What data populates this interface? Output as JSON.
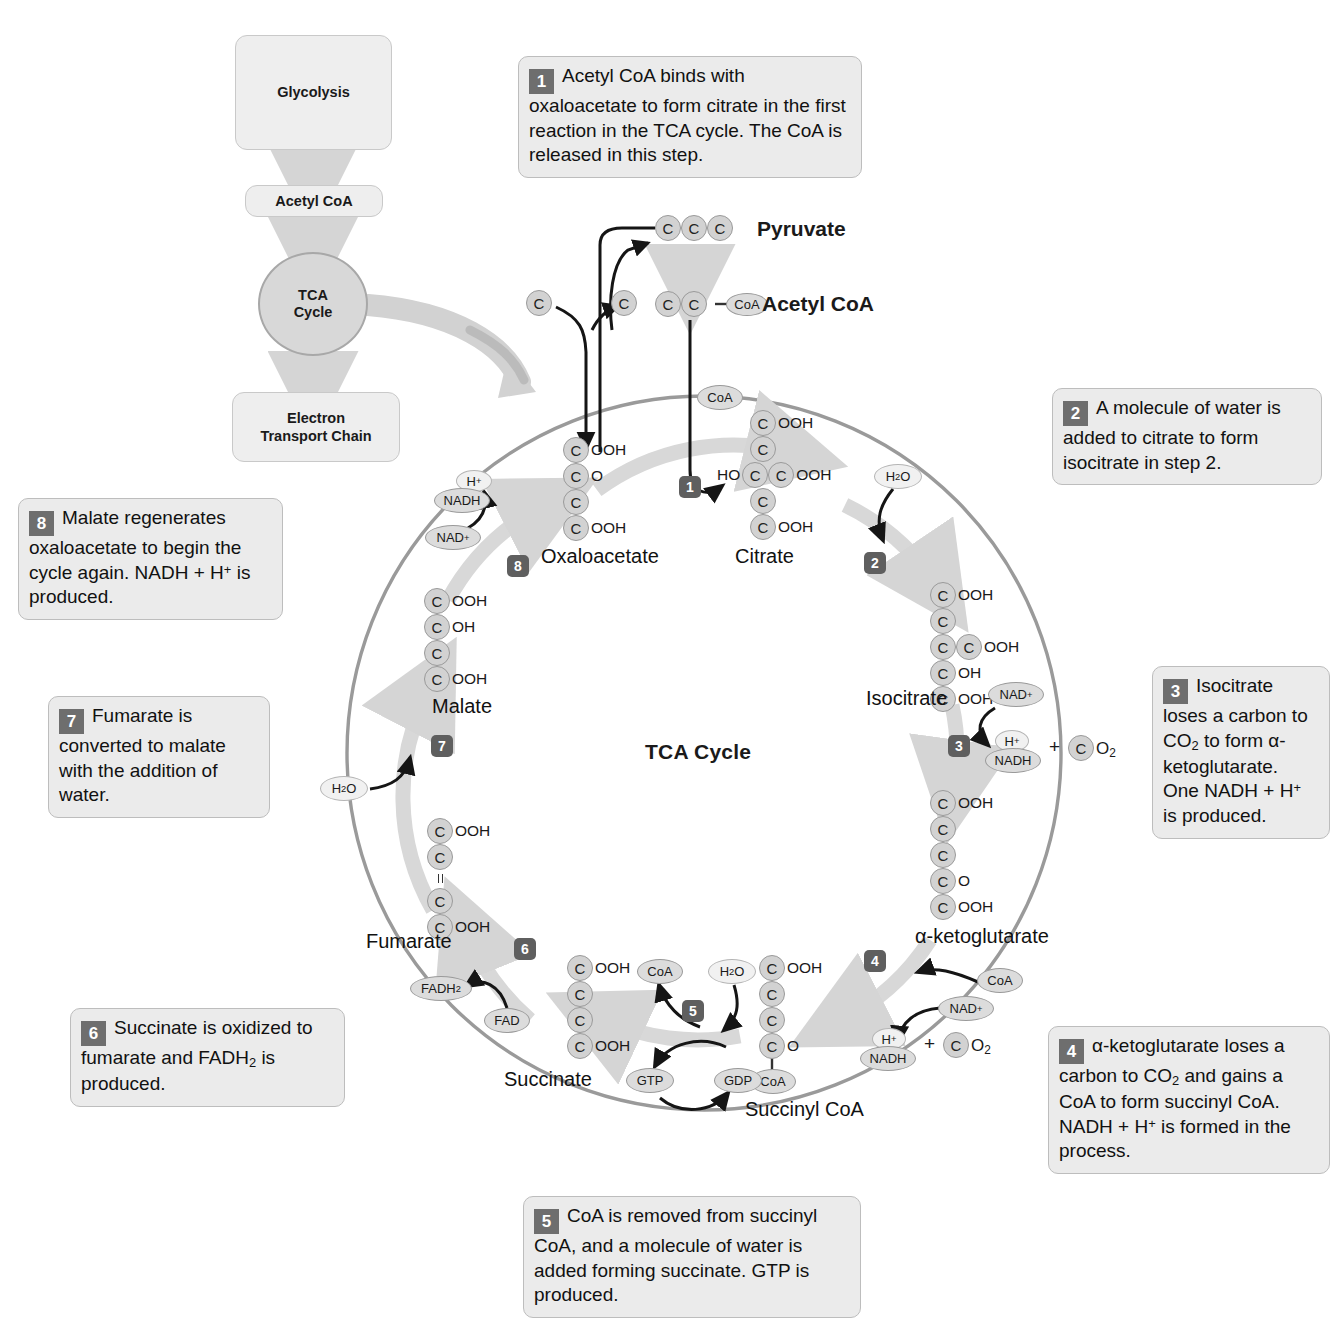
{
  "title": "TCA Cycle",
  "center_label": "TCA Cycle",
  "flow": {
    "glycolysis": "Glycolysis",
    "acetyl_coa": "Acetyl CoA",
    "tca_line1": "TCA",
    "tca_line2": "Cycle",
    "etc_line1": "Electron",
    "etc_line2": "Transport Chain"
  },
  "top_labels": {
    "pyruvate": "Pyruvate",
    "acetyl_coa": "Acetyl CoA",
    "coa": "CoA",
    "c": "C"
  },
  "callouts": [
    {
      "num": "1",
      "text": "Acetyl CoA binds with oxaloacetate to form citrate in the first reaction in the TCA cycle. The CoA is released in this step."
    },
    {
      "num": "2",
      "text": "A molecule of water is added to citrate to form isocitrate in step 2."
    },
    {
      "num": "3",
      "text": "Isocitrate loses a carbon to CO2 to form α-ketoglutarate. One NADH + H+ is produced."
    },
    {
      "num": "4",
      "text": "α-ketoglutarate loses a carbon to CO2 and gains a CoA to form succinyl CoA. NADH + H+ is formed in the process."
    },
    {
      "num": "5",
      "text": "CoA is removed from succinyl CoA, and a molecule of water is added forming succinate. GTP is produced."
    },
    {
      "num": "6",
      "text": "Succinate is oxidized to fumarate and FADH2 is produced."
    },
    {
      "num": "7",
      "text": "Fumarate is converted to malate with the addition of water."
    },
    {
      "num": "8",
      "text": "Malate regenerates oxaloacetate to begin the cycle again. NADH + H+ is produced."
    }
  ],
  "metabolites": [
    {
      "name": "Oxaloacetate",
      "carbons": 4,
      "groups": [
        "OOH",
        "O",
        "",
        "OOH"
      ]
    },
    {
      "name": "Citrate",
      "carbons": 6,
      "groups": [
        "OOH",
        "",
        "OOH",
        "",
        "OOH"
      ],
      "branch": "HO"
    },
    {
      "name": "Isocitrate",
      "carbons": 6,
      "groups": [
        "OOH",
        "",
        "OOH",
        "OH",
        "OOH"
      ]
    },
    {
      "name": "α-ketoglutarate",
      "carbons": 5,
      "groups": [
        "OOH",
        "",
        "",
        "O",
        "OOH"
      ]
    },
    {
      "name": "Succinyl CoA",
      "carbons": 4,
      "groups": [
        "OOH",
        "",
        "",
        "O",
        "CoA"
      ]
    },
    {
      "name": "Succinate",
      "carbons": 4,
      "groups": [
        "OOH",
        "",
        "",
        "OOH"
      ]
    },
    {
      "name": "Fumarate",
      "carbons": 4,
      "groups": [
        "OOH",
        "",
        "",
        "OOH"
      ],
      "double_bond": true
    },
    {
      "name": "Malate",
      "carbons": 4,
      "groups": [
        "OOH",
        "OH",
        "",
        "OOH"
      ]
    }
  ],
  "cofactors": {
    "nad_plus": "NAD+",
    "nadh": "NADH",
    "h_plus": "H+",
    "fad": "FAD",
    "fadh2": "FADH2",
    "gtp": "GTP",
    "gdp": "GDP",
    "water": "H2O",
    "coa": "CoA",
    "co2": "O2",
    "plus": "+"
  },
  "step_numbers": [
    "1",
    "2",
    "3",
    "4",
    "5",
    "6",
    "7",
    "8"
  ],
  "colors": {
    "ring": "#9a9a9a",
    "arrow_gray": "#d5d5d5",
    "badge": "#5f5f5f",
    "box_fill": "#ebebeb",
    "atom_fill": "#d2d2d2"
  }
}
